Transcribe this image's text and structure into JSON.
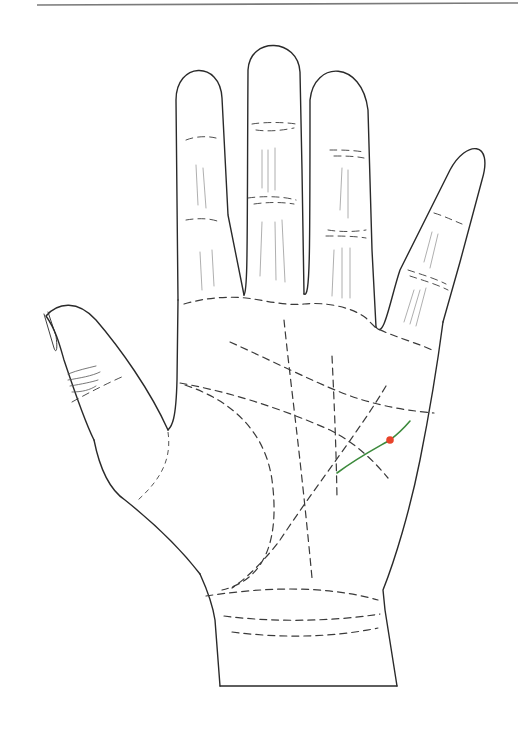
{
  "diagram": {
    "hand": "right-hand-palm-view",
    "colors": {
      "outline": "#2a2a2a",
      "dashed_lines": "#3a3a3a",
      "highlight_line": "#3c8a3c",
      "marker_dot": "#e8432a",
      "top_rule": "#7a7a7a"
    },
    "highlight": {
      "line": "green-line",
      "marker": "red-dot"
    }
  }
}
